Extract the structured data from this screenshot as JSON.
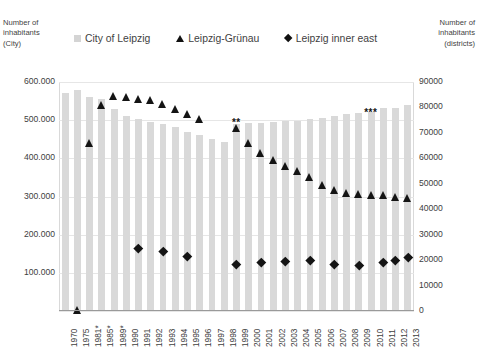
{
  "axes": {
    "left_title": "Number of\ninhabitants\n(City)",
    "right_title": "Number of\ninhabitants\n(districts)",
    "left_ticks": [
      "600.000",
      "500.000",
      "400.000",
      "300.000",
      "200.000",
      "100.000",
      ""
    ],
    "right_ticks": [
      "90000",
      "80000",
      "70000",
      "60000",
      "50000",
      "40000",
      "30000",
      "20000",
      "10000",
      "0"
    ]
  },
  "legend": {
    "items": [
      {
        "label": "City of Leipzig",
        "marker": "square-swatch",
        "color": "#d4d4d4"
      },
      {
        "label": "Leipzig-Grünau",
        "marker": "triangle-swatch",
        "color": "#111111"
      },
      {
        "label": "Leipzig inner east",
        "marker": "diamond-swatch",
        "color": "#111111"
      }
    ]
  },
  "annotations": [
    {
      "text": "**",
      "x_index": 14.2,
      "value": 73500
    },
    {
      "text": "***",
      "x_index": 25.0,
      "value": 77500
    }
  ],
  "chart_data": {
    "type": "bar",
    "title": "",
    "xlabel": "",
    "ylabel": "Number of inhabitants (City)",
    "ylabel_secondary": "Number of inhabitants (districts)",
    "ylim": [
      0,
      600000
    ],
    "ylim_secondary": [
      0,
      90000
    ],
    "grid": true,
    "legend_position": "top",
    "categories": [
      "1970",
      "1975",
      "1981*",
      "1985*",
      "1989*",
      "1990",
      "1991",
      "1992",
      "1993",
      "1994",
      "1995",
      "1996",
      "1997",
      "1998",
      "1999",
      "2000",
      "2001",
      "2002",
      "2003",
      "2004",
      "2005",
      "2006",
      "2007",
      "2008",
      "2009",
      "2010",
      "2011",
      "2012",
      "2013"
    ],
    "series": [
      {
        "name": "City of Leipzig",
        "type": "bar",
        "axis": "left",
        "color": "#d9d9d9",
        "values": [
          572000,
          580000,
          562000,
          556000,
          530000,
          511000,
          503000,
          496000,
          490000,
          481000,
          470000,
          461000,
          452000,
          444000,
          490000,
          493000,
          493000,
          494000,
          497000,
          498000,
          503000,
          506000,
          510000,
          515000,
          518000,
          522000,
          531000,
          531000,
          540000
        ]
      },
      {
        "name": "Leipzig-Grünau",
        "type": "scatter",
        "axis": "right",
        "marker": "triangle",
        "color": "#141414",
        "values": [
          null,
          400,
          66000,
          81000,
          84500,
          84000,
          83500,
          83000,
          81500,
          79500,
          77500,
          75500,
          null,
          null,
          72000,
          66000,
          62000,
          59500,
          57000,
          55000,
          52500,
          49500,
          47500,
          46500,
          46000,
          45500,
          45500,
          45000,
          44500
        ]
      },
      {
        "name": "Leipzig inner east",
        "type": "scatter",
        "axis": "right",
        "marker": "diamond",
        "color": "#141414",
        "values": [
          null,
          null,
          null,
          null,
          null,
          null,
          24500,
          null,
          23500,
          null,
          21500,
          null,
          null,
          null,
          18500,
          null,
          19000,
          null,
          19500,
          null,
          19800,
          null,
          18500,
          null,
          18000,
          null,
          19000,
          19800,
          21000
        ]
      }
    ]
  }
}
